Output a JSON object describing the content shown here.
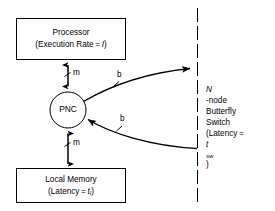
{
  "diagram": {
    "background_color": "#ffffff",
    "stroke_color": "#000000",
    "processor_box": {
      "line1": "Processor",
      "line2_prefix": "(Execution Rate = ",
      "line2_var": "I",
      "line2_suffix": ")"
    },
    "memory_box": {
      "line1": "Local Memory",
      "line2_prefix": "(Latency = ",
      "line2_var": "t",
      "line2_subscript": "l",
      "line2_suffix": ")"
    },
    "pnc_node": {
      "label": "PNC"
    },
    "switch_label": {
      "line1_var": "N",
      "line1_rest": "-node",
      "line2": "Butterfly",
      "line3": "Switch",
      "line4_prefix": "(Latency = ",
      "line4_var": "t",
      "line4_subscript": "sw",
      "line4_suffix": ")"
    },
    "edges": [
      {
        "id": "processor-link",
        "label": "m",
        "style": "double-arrow-vertical",
        "tick": true
      },
      {
        "id": "memory-link",
        "label": "m",
        "style": "double-arrow-vertical",
        "tick": true
      },
      {
        "id": "outbound-network",
        "label": "b",
        "style": "curve-arrow-to-switch",
        "tick": true
      },
      {
        "id": "inbound-network",
        "label": "b",
        "style": "curve-arrow-from-switch",
        "tick": true
      }
    ],
    "boundary_line": {
      "name": "switch-boundary",
      "style": "dash-dot-vertical"
    }
  }
}
